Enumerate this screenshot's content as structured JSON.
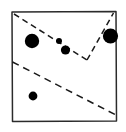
{
  "figure": {
    "canvas": {
      "width": 126,
      "height": 132
    },
    "background_color": "#ffffff",
    "ink_color": "#1a1a1a",
    "frame_color": "#2b2b2b"
  },
  "chart_data": {
    "type": "scatter",
    "title": "",
    "subtitle": "",
    "xlabel": "",
    "ylabel": "",
    "xlim": [
      11,
      117
    ],
    "ylim": [
      11,
      122
    ],
    "grid": false,
    "legend": "none",
    "annotations": [],
    "point_color": "#000000",
    "series": [
      {
        "name": "points",
        "marker": "filled-circle",
        "points": [
          {
            "id": "p1",
            "label": "large-left",
            "x": 32,
            "y": 41,
            "r": 7.2
          },
          {
            "id": "p2",
            "label": "small-middle",
            "x": 59,
            "y": 41,
            "r": 3.0
          },
          {
            "id": "p3",
            "label": "medium-middle",
            "x": 65.5,
            "y": 50,
            "r": 4.6
          },
          {
            "id": "p4",
            "label": "large-right",
            "x": 110.5,
            "y": 36,
            "r": 7.6
          },
          {
            "id": "p5",
            "label": "medium-bottom-left",
            "x": 33,
            "y": 96,
            "r": 4.4
          }
        ]
      }
    ],
    "frame": {
      "name": "hand-drawn-square-border",
      "points": [
        [
          12,
          12
        ],
        [
          116,
          11.5
        ],
        [
          116.5,
          121
        ],
        [
          12.5,
          121.5
        ]
      ],
      "closed": true
    },
    "partitions": [
      {
        "id": "d1",
        "name": "upper-dashed-boundary",
        "style": "dashed",
        "dash_pattern": "6 4",
        "points": [
          [
            14,
            14
          ],
          [
            87,
            60
          ]
        ]
      },
      {
        "id": "d2",
        "name": "upper-right-dashed-boundary",
        "style": "dashed",
        "dash_pattern": "6 4",
        "points": [
          [
            87,
            60
          ],
          [
            113.5,
            13
          ]
        ]
      },
      {
        "id": "d3",
        "name": "lower-dashed-boundary",
        "style": "dashed",
        "dash_pattern": "7 5",
        "points": [
          [
            12.5,
            62
          ],
          [
            116,
            115
          ]
        ]
      }
    ]
  }
}
